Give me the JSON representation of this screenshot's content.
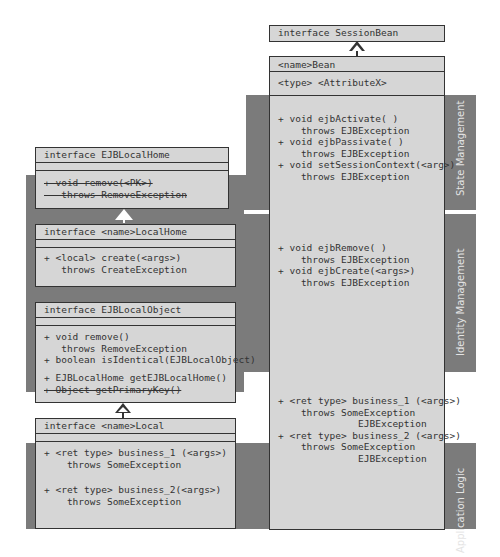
{
  "bands": [
    {
      "label": "State Management"
    },
    {
      "label": "Identity Management"
    },
    {
      "label": "Application Logic"
    }
  ],
  "session_bean_interface": {
    "title": "interface SessionBean"
  },
  "bean_class": {
    "name": "<name>Bean",
    "attribute": "<type> <AttributeX>",
    "state_methods": "+ void ejbActivate( )\n    throws EJBException\n+ void ejbPassivate( )\n    throws EJBException\n+ void setSessionContext(<arg>)\n    throws EJBException",
    "identity_methods": "+ void ejbRemove( )\n    throws EJBException\n+ void ejbCreate(<args>)\n    throws EJBException",
    "business_methods": "+ <ret type> business_1 (<args>)\n    throws SomeException\n              EJBException\n+ <ret type> business_2 (<args>)\n    throws SomeException\n              EJBException"
  },
  "ejb_local_home": {
    "title": "interface EJBLocalHome",
    "methods_struck": "+ void remove(<PK>)\n   throws RemoveException"
  },
  "local_home": {
    "title": "interface <name>LocalHome",
    "methods": "+ <local> create(<args>)\n   throws CreateException"
  },
  "ejb_local_object": {
    "title": "interface EJBLocalObject",
    "methods": "+ void remove()\n   throws RemoveException\n+ boolean isIdentical(EJBLocalObject)",
    "methods2": "+ EJBLocalHome getEJBLocalHome()",
    "methods_struck": "+ Object getPrimaryKey()"
  },
  "local": {
    "title": "interface <name>Local",
    "method1": "+ <ret type> business_1 (<args>)\n    throws SomeException",
    "method2": "+ <ret type> business_2(<args>)\n    throws SomeException"
  },
  "colors": {
    "band": "#7b7b7b",
    "box": "#d6d6d6",
    "border": "#333333"
  }
}
